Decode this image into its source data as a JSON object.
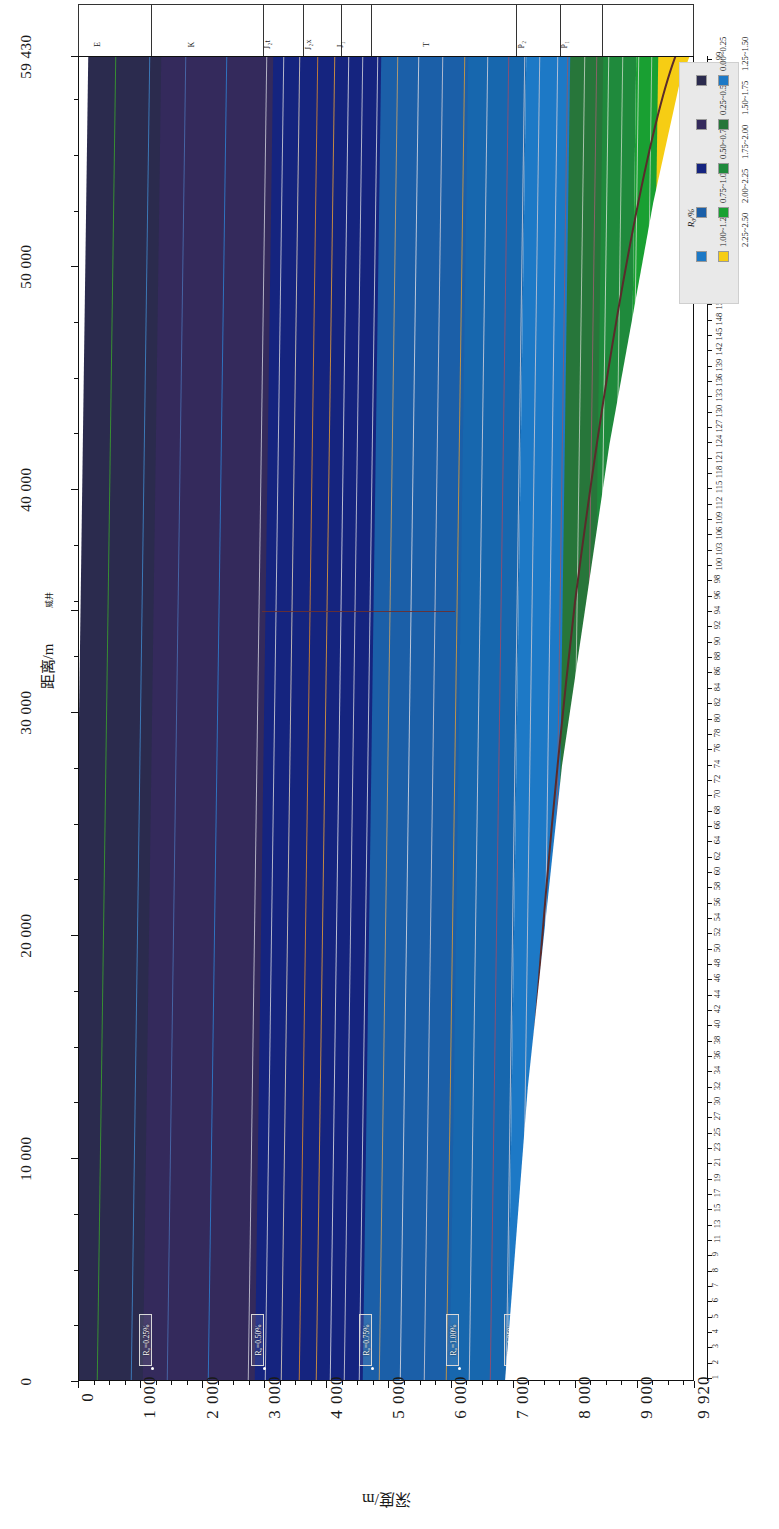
{
  "figure": {
    "kind": "geological-cross-section",
    "background": "#ffffff"
  },
  "chart_data": {
    "type": "heatmap",
    "title": "",
    "xlabel": "深度/m",
    "ylabel": "距离/m",
    "orientation": "rotated-90",
    "grid": false,
    "legend_position": "top-right",
    "xlim": [
      0,
      9920
    ],
    "ylim": [
      0,
      59430
    ],
    "x_ticks": [
      "0",
      "1 000",
      "2 000",
      "3 000",
      "4 000",
      "5 000",
      "6 000",
      "7 000",
      "8 000",
      "9 000",
      "9 920"
    ],
    "x_tick_values": [
      0,
      1000,
      2000,
      3000,
      4000,
      5000,
      6000,
      7000,
      8000,
      9000,
      9920
    ],
    "y_ticks": [
      "0",
      "10 000",
      "20 000",
      "30 000",
      "40 000",
      "50 000",
      "59 430"
    ],
    "y_tick_values": [
      0,
      10000,
      20000,
      30000,
      40000,
      50000,
      59430
    ],
    "right_axis_label": "",
    "right_axis_ticks": [
      "1",
      "2",
      "3",
      "4",
      "5",
      "6",
      "7",
      "8",
      "9",
      "11",
      "13",
      "15",
      "17",
      "19",
      "21",
      "23",
      "25",
      "27",
      "30",
      "32",
      "34",
      "36",
      "38",
      "40",
      "42",
      "44",
      "46",
      "48",
      "50",
      "52",
      "54",
      "56",
      "58",
      "60",
      "62",
      "64",
      "66",
      "68",
      "70",
      "72",
      "74",
      "76",
      "78",
      "80",
      "82",
      "84",
      "86",
      "88",
      "90",
      "92",
      "94",
      "96",
      "98",
      "100",
      "103",
      "106",
      "109",
      "112",
      "115",
      "118",
      "121",
      "124",
      "127",
      "130",
      "133",
      "136",
      "139",
      "142",
      "145",
      "148",
      "151",
      "154",
      "157",
      "160",
      "163",
      "166",
      "169",
      "172",
      "175",
      "178",
      "181",
      "184",
      "187",
      "190",
      "193",
      "196",
      "199"
    ],
    "zones": [
      {
        "label": "0.00~0.25",
        "color": "#2b2b4e",
        "x_start": 0,
        "x_end": 1180
      },
      {
        "label": "0.25~0.50",
        "color": "#342a5c",
        "x_start": 1180,
        "x_end": 2980
      },
      {
        "label": "0.50~0.75",
        "color": "#15247f",
        "x_start": 2980,
        "x_end": 4720
      },
      {
        "label": "0.75~1.00",
        "color": "#1b5fa8",
        "x_start": 4720,
        "x_end": 6120
      },
      {
        "label": "1.00~1.25",
        "color": "#1767ae",
        "x_start": 6120,
        "x_end": 7050
      },
      {
        "label": "1.25~1.50",
        "color": "#1d79c6",
        "x_start": 7050,
        "x_end": 7760
      },
      {
        "label": "1.50~1.75",
        "color": "#27763a",
        "x_start": 7760,
        "x_end": 8300
      },
      {
        "label": "1.75~2.00",
        "color": "#1f8a3c",
        "x_start": 8300,
        "x_end": 8820
      },
      {
        "label": "2.00~2.25",
        "color": "#19a032",
        "x_start": 8820,
        "x_end": 9180
      },
      {
        "label": "2.25~2.50",
        "color": "#f6cd14",
        "x_start": 9180,
        "x_end": 9920
      }
    ],
    "contours": [
      {
        "label": "R₀=0.25%",
        "x": 1180
      },
      {
        "label": "R₀=0.50%",
        "x": 2980
      },
      {
        "label": "R₀=0.75%",
        "x": 4720
      },
      {
        "label": "R₀=1.00%",
        "x": 6120
      },
      {
        "label": "R₀=1.25%",
        "x": 7050
      },
      {
        "label": "R₀=1.50%",
        "x": 7760
      },
      {
        "label": "R₀=1.75%",
        "x": 8300
      },
      {
        "label": "R₀=2.00%",
        "x": 8820
      },
      {
        "label": "R₀=2.25%",
        "x": 9180
      }
    ]
  },
  "axes": {
    "distance": {
      "title": "距离/m",
      "ticks": [
        {
          "label": "0",
          "value": 0
        },
        {
          "label": "10 000",
          "value": 10000
        },
        {
          "label": "20 000",
          "value": 20000
        },
        {
          "label": "30 000",
          "value": 30000
        },
        {
          "label": "40 000",
          "value": 40000
        },
        {
          "label": "50 000",
          "value": 50000
        },
        {
          "label": "59 430",
          "value": 59430
        }
      ],
      "well_marker": "威井",
      "well_value": 34600
    },
    "depth": {
      "title": "深度/m",
      "ticks": [
        {
          "label": "0",
          "value": 0
        },
        {
          "label": "1 000",
          "value": 1000
        },
        {
          "label": "2 000",
          "value": 2000
        },
        {
          "label": "3 000",
          "value": 3000
        },
        {
          "label": "4 000",
          "value": 4000
        },
        {
          "label": "5 000",
          "value": 5000
        },
        {
          "label": "6 000",
          "value": 6000
        },
        {
          "label": "7 000",
          "value": 7000
        },
        {
          "label": "8 000",
          "value": 8000
        },
        {
          "label": "9 000",
          "value": 9000
        },
        {
          "label": "9 920",
          "value": 9920
        }
      ]
    },
    "index": {
      "labels": [
        "1",
        "2",
        "3",
        "4",
        "5",
        "6",
        "7",
        "8",
        "9",
        "11",
        "13",
        "15",
        "17",
        "19",
        "21",
        "23",
        "25",
        "27",
        "30",
        "32",
        "34",
        "36",
        "38",
        "40",
        "42",
        "44",
        "46",
        "48",
        "50",
        "52",
        "54",
        "56",
        "58",
        "60",
        "62",
        "64",
        "66",
        "68",
        "70",
        "72",
        "74",
        "76",
        "78",
        "80",
        "82",
        "84",
        "86",
        "88",
        "90",
        "92",
        "94",
        "96",
        "98",
        "100",
        "103",
        "106",
        "109",
        "112",
        "115",
        "118",
        "121",
        "124",
        "127",
        "130",
        "133",
        "136",
        "139",
        "142",
        "145",
        "148",
        "151",
        "154",
        "157",
        "160",
        "163",
        "166",
        "169",
        "172",
        "175",
        "178",
        "181",
        "184",
        "187",
        "190",
        "193",
        "196",
        "199"
      ]
    }
  },
  "stratigraphy": {
    "units": [
      {
        "label": "E",
        "x_start": 0,
        "x_end": 1180
      },
      {
        "label": "K",
        "x_start": 1180,
        "x_end": 2980
      },
      {
        "label": "J₂t",
        "x_start": 2980,
        "x_end": 3620
      },
      {
        "label": "J₂x",
        "x_start": 3620,
        "x_end": 4240
      },
      {
        "label": "J₁",
        "x_start": 4240,
        "x_end": 4720
      },
      {
        "label": "T",
        "x_start": 4720,
        "x_end": 7050
      },
      {
        "label": "P₂",
        "x_start": 7050,
        "x_end": 7760
      },
      {
        "label": "P₁",
        "x_start": 7760,
        "x_end": 8440
      },
      {
        "label": "",
        "x_start": 8440,
        "x_end": 9920
      }
    ]
  },
  "legend": {
    "title": "R₀/%",
    "column_left": [
      {
        "label": "0.00~0.25",
        "color": "#2b2b4e"
      },
      {
        "label": "0.25~0.50",
        "color": "#342a5c"
      },
      {
        "label": "0.50~0.75",
        "color": "#15247f"
      },
      {
        "label": "0.75~1.00",
        "color": "#1b5fa8"
      },
      {
        "label": "1.00~1.25",
        "color": "#1d79c6"
      }
    ],
    "column_right": [
      {
        "label": "1.25~1.50",
        "color": "#1d79c6"
      },
      {
        "label": "1.50~1.75",
        "color": "#27763a"
      },
      {
        "label": "1.75~2.00",
        "color": "#1f8a3c"
      },
      {
        "label": "2.00~2.25",
        "color": "#19a032"
      },
      {
        "label": "2.25~2.50",
        "color": "#f6cd14"
      }
    ]
  },
  "contour_callouts": [
    {
      "label": "R₀=0.25%"
    },
    {
      "label": "R₀=0.50%"
    },
    {
      "label": "R₀=0.75%"
    },
    {
      "label": "R₀=1.00%"
    },
    {
      "label": "R₀=1.25%"
    },
    {
      "label": "R₀=1.50%"
    },
    {
      "label": "R₀=1.75%"
    },
    {
      "label": "R₀=2.00%"
    },
    {
      "label": "R₀=2.25%"
    }
  ]
}
